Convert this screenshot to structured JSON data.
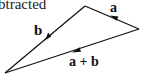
{
  "caption": {
    "text": "btracted"
  },
  "diagram": {
    "type": "vector-triangle",
    "vertices": {
      "top": [
        85,
        6
      ],
      "right": [
        139,
        29
      ],
      "bottom_left": [
        5,
        73
      ]
    },
    "vectors": [
      {
        "id": "a",
        "label": "a",
        "from": "right",
        "to": "top",
        "arrow_direction": "up-left"
      },
      {
        "id": "b",
        "label": "b",
        "from": "top",
        "to": "bottom_left",
        "arrow_direction": "down-left"
      },
      {
        "id": "a_plus_b",
        "label": "a + b",
        "from": "right",
        "to": "bottom_left",
        "arrow_direction": "left"
      }
    ],
    "stroke_color": "#111111"
  }
}
